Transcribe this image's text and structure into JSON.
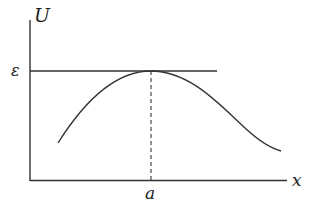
{
  "diagram": {
    "type": "potential-energy-curve",
    "labels": {
      "y_axis": "U",
      "x_axis": "x",
      "level": "ε",
      "peak_position": "a"
    },
    "colors": {
      "stroke": "#333333",
      "text": "#222222",
      "background": "#ffffff"
    }
  }
}
